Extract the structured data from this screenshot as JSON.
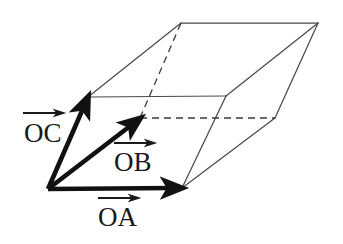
{
  "figure": {
    "type": "parallelepiped-vector-diagram",
    "background_color": "#ffffff",
    "edge_color": "#4a4a4a",
    "vector_color": "#111111",
    "label_color": "#1a1a1a",
    "dashed_color": "#3a3a3a",
    "labels": {
      "oa": "OA",
      "ob": "OB",
      "oc": "OC"
    },
    "vectors": [
      {
        "name": "OA",
        "label": "OA",
        "from": [
          48,
          189
        ],
        "to": [
          182,
          188
        ],
        "label_position": [
          121,
          218
        ],
        "arrow_over": true
      },
      {
        "name": "OB",
        "label": "OB",
        "from": [
          48,
          189
        ],
        "to": [
          140,
          118
        ],
        "label_position": [
          133,
          165
        ],
        "arrow_over": true
      },
      {
        "name": "OC",
        "label": "OC",
        "from": [
          48,
          189
        ],
        "to": [
          88,
          97
        ],
        "label_position": [
          43,
          136
        ],
        "arrow_over": true
      }
    ],
    "vertices": {
      "O": [
        48,
        189
      ],
      "A": [
        182,
        188
      ],
      "B": [
        140,
        118
      ],
      "C": [
        88,
        97
      ],
      "AB": [
        275,
        118
      ],
      "BC": [
        181,
        23
      ],
      "AC": [
        226,
        96
      ],
      "ABC": [
        318,
        23
      ]
    },
    "solid_edges": [
      [
        "O",
        "A"
      ],
      [
        "O",
        "C"
      ],
      [
        "C",
        "AC"
      ],
      [
        "C",
        "BC"
      ],
      [
        "BC",
        "ABC"
      ],
      [
        "ABC",
        "AC"
      ],
      [
        "ABC",
        "AB"
      ],
      [
        "AC",
        "A"
      ],
      [
        "A",
        "AB"
      ]
    ],
    "dashed_edges": [
      [
        "B",
        "BC"
      ],
      [
        "B",
        "AB"
      ]
    ]
  }
}
